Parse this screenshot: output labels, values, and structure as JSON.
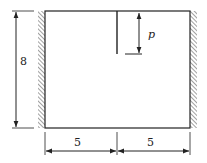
{
  "diagram": {
    "type": "structural-plate-with-crack",
    "colors": {
      "line": "#222222",
      "hatch": "#444444",
      "background": "#ffffff"
    },
    "plate": {
      "width_units": 10,
      "height_units": 8
    },
    "supports": [
      {
        "side": "left",
        "type": "fixed-wall-hatched"
      },
      {
        "side": "right",
        "type": "fixed-wall-hatched"
      }
    ],
    "crack": {
      "from": "top-edge-midpoint",
      "length_label": "p"
    },
    "dimensions": {
      "height_label": "8",
      "left_width_label": "5",
      "right_width_label": "5",
      "crack_length_label": "p"
    }
  }
}
